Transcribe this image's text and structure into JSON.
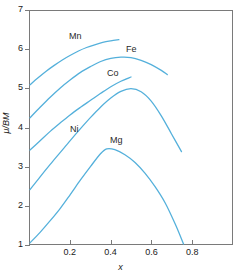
{
  "chart_data": {
    "type": "line",
    "title": "",
    "subtitle": "",
    "xlabel": "x",
    "ylabel": "μ/BM",
    "xlim": [
      0.0,
      1.0
    ],
    "ylim": [
      1,
      7
    ],
    "xticks": [
      "0.2",
      "0.4",
      "0.6",
      "0.8"
    ],
    "xtick_values": [
      0.2,
      0.4,
      0.6,
      0.8
    ],
    "yticks": [
      "1",
      "2",
      "3",
      "4",
      "5",
      "6",
      "7"
    ],
    "ytick_values": [
      1,
      2,
      3,
      4,
      5,
      6,
      7
    ],
    "grid": false,
    "legend_position": "inline-annotations",
    "line_color": "#54B0DB",
    "axis_color": "#7a7a7a",
    "series": [
      {
        "name": "Mn",
        "label": "Mn",
        "x": [
          0.0,
          0.04,
          0.08,
          0.12,
          0.16,
          0.2,
          0.24,
          0.28,
          0.32,
          0.36,
          0.4,
          0.44
        ],
        "values": [
          5.1,
          5.28,
          5.45,
          5.6,
          5.74,
          5.86,
          5.97,
          6.06,
          6.13,
          6.19,
          6.23,
          6.26
        ]
      },
      {
        "name": "Fe",
        "label": "Fe",
        "x": [
          0.0,
          0.05,
          0.1,
          0.15,
          0.2,
          0.25,
          0.3,
          0.35,
          0.4,
          0.45,
          0.5,
          0.55,
          0.6,
          0.65,
          0.68
        ],
        "values": [
          4.25,
          4.52,
          4.78,
          5.02,
          5.23,
          5.42,
          5.57,
          5.7,
          5.78,
          5.81,
          5.8,
          5.73,
          5.62,
          5.47,
          5.36
        ]
      },
      {
        "name": "Co",
        "label": "Co",
        "x": [
          0.0,
          0.05,
          0.1,
          0.15,
          0.2,
          0.25,
          0.3,
          0.35,
          0.4,
          0.45,
          0.5
        ],
        "values": [
          3.42,
          3.66,
          3.9,
          4.12,
          4.33,
          4.52,
          4.7,
          4.88,
          5.05,
          5.19,
          5.3
        ]
      },
      {
        "name": "Ni",
        "label": "Ni",
        "x": [
          0.0,
          0.05,
          0.1,
          0.15,
          0.2,
          0.25,
          0.3,
          0.35,
          0.4,
          0.45,
          0.5,
          0.55,
          0.6,
          0.65,
          0.7,
          0.75
        ],
        "values": [
          2.4,
          2.73,
          3.05,
          3.36,
          3.67,
          3.97,
          4.26,
          4.53,
          4.76,
          4.93,
          5.0,
          4.92,
          4.68,
          4.3,
          3.84,
          3.38
        ]
      },
      {
        "name": "Mg",
        "label": "Mg",
        "x": [
          0.0,
          0.05,
          0.1,
          0.15,
          0.2,
          0.25,
          0.3,
          0.35,
          0.38,
          0.42,
          0.47,
          0.52,
          0.57,
          0.62,
          0.67,
          0.72,
          0.76
        ],
        "values": [
          1.03,
          1.3,
          1.6,
          1.92,
          2.28,
          2.65,
          3.0,
          3.33,
          3.45,
          3.43,
          3.3,
          3.1,
          2.82,
          2.47,
          2.05,
          1.5,
          1.0
        ]
      }
    ],
    "annotations": [
      {
        "text": "Mn",
        "x_px": 69,
        "y_px": 32
      },
      {
        "text": "Fe",
        "x_px": 126,
        "y_px": 45
      },
      {
        "text": "Co",
        "x_px": 107,
        "y_px": 69
      },
      {
        "text": "Ni",
        "x_px": 70,
        "y_px": 125
      },
      {
        "text": "Mg",
        "x_px": 110,
        "y_px": 136
      }
    ]
  }
}
